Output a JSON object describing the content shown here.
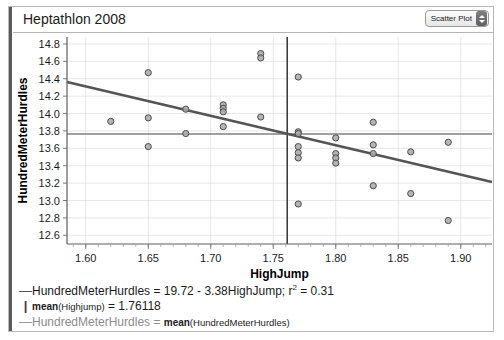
{
  "window": {
    "title": "Heptathlon 2008"
  },
  "toolbar": {
    "plot_type_label": "Scatter Plot",
    "stepper_icon": "up-down-stepper-icon"
  },
  "chart_data": {
    "type": "scatter",
    "title": "Heptathlon 2008",
    "xlabel": "HighJump",
    "ylabel": "HundredMeterHurdles",
    "xlim": [
      1.585,
      1.925
    ],
    "ylim": [
      12.5,
      14.88
    ],
    "xticks": [
      "1.60",
      "1.65",
      "1.70",
      "1.75",
      "1.80",
      "1.85",
      "1.90"
    ],
    "xtick_values": [
      1.6,
      1.65,
      1.7,
      1.75,
      1.8,
      1.85,
      1.9
    ],
    "yticks": [
      "14.8",
      "14.6",
      "14.4",
      "14.2",
      "14.0",
      "13.8",
      "13.6",
      "13.4",
      "13.2",
      "13.0",
      "12.8",
      "12.6"
    ],
    "ytick_values": [
      14.8,
      14.6,
      14.4,
      14.2,
      14.0,
      13.8,
      13.6,
      13.4,
      13.2,
      13.0,
      12.8,
      12.6
    ],
    "grid": true,
    "legend_position": "below",
    "points": [
      {
        "x": 1.62,
        "y": 13.91
      },
      {
        "x": 1.65,
        "y": 14.47
      },
      {
        "x": 1.65,
        "y": 13.95
      },
      {
        "x": 1.65,
        "y": 13.62
      },
      {
        "x": 1.68,
        "y": 14.05
      },
      {
        "x": 1.68,
        "y": 13.77
      },
      {
        "x": 1.71,
        "y": 14.1
      },
      {
        "x": 1.71,
        "y": 14.06
      },
      {
        "x": 1.71,
        "y": 14.02
      },
      {
        "x": 1.71,
        "y": 13.85
      },
      {
        "x": 1.74,
        "y": 14.69
      },
      {
        "x": 1.74,
        "y": 14.64
      },
      {
        "x": 1.74,
        "y": 13.96
      },
      {
        "x": 1.77,
        "y": 14.42
      },
      {
        "x": 1.77,
        "y": 13.79
      },
      {
        "x": 1.77,
        "y": 13.77
      },
      {
        "x": 1.77,
        "y": 13.62
      },
      {
        "x": 1.77,
        "y": 13.55
      },
      {
        "x": 1.77,
        "y": 13.49
      },
      {
        "x": 1.77,
        "y": 12.96
      },
      {
        "x": 1.8,
        "y": 13.72
      },
      {
        "x": 1.8,
        "y": 13.54
      },
      {
        "x": 1.8,
        "y": 13.49
      },
      {
        "x": 1.8,
        "y": 13.43
      },
      {
        "x": 1.83,
        "y": 13.9
      },
      {
        "x": 1.83,
        "y": 13.64
      },
      {
        "x": 1.83,
        "y": 13.54
      },
      {
        "x": 1.83,
        "y": 13.17
      },
      {
        "x": 1.86,
        "y": 13.56
      },
      {
        "x": 1.86,
        "y": 13.08
      },
      {
        "x": 1.89,
        "y": 13.67
      },
      {
        "x": 1.89,
        "y": 12.77
      }
    ],
    "fit_line": {
      "intercept": 19.72,
      "slope": -3.38,
      "r_squared": 0.31
    },
    "mean_x": 1.76118,
    "mean_y": 13.765
  },
  "legend": {
    "rows": [
      {
        "marker": "dash-dark",
        "marker_glyph": "—",
        "text": "HundredMeterHurdles = 19.72 - 3.38HighJump; r",
        "superscript": "2",
        "text_tail": " = 0.31"
      },
      {
        "marker": "bar-dark",
        "marker_glyph": "|",
        "prefix": "mean",
        "paren": "(Highjump)",
        "text_tail": " = 1.76118"
      },
      {
        "marker": "dash-gray",
        "marker_glyph": "—",
        "text": "HundredMeterHurdles = ",
        "mean_word": "mean",
        "paren": "(HundredMeterHurdles)"
      }
    ]
  },
  "colors": {
    "point_fill": "#a8a8a8",
    "point_stroke": "#4c4c4c",
    "fit_line": "#555555",
    "mean_h_line": "#808080",
    "mean_v_line": "#3c3c3c",
    "grid": "#dcdcdc"
  }
}
